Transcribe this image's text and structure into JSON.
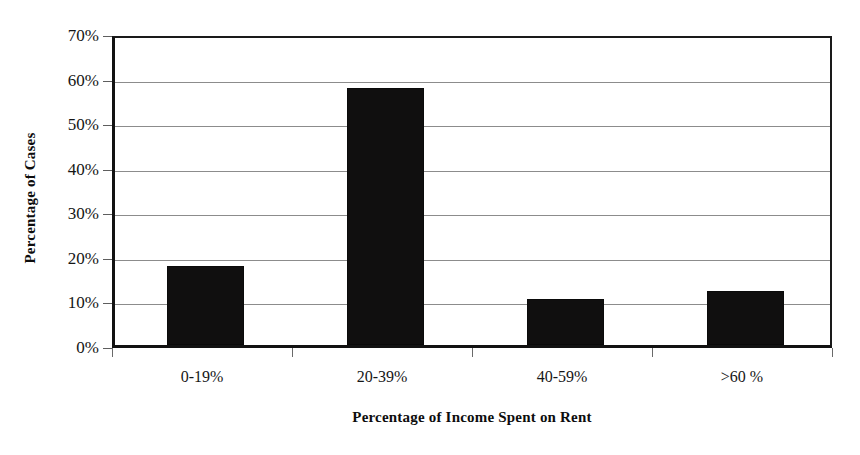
{
  "chart_data": {
    "type": "bar",
    "title": "",
    "categories": [
      "0-19%",
      "20-39%",
      "40-59%",
      ">60 %"
    ],
    "values": [
      17.8,
      57.6,
      10.3,
      12.2
    ],
    "series": [
      {
        "name": "Percentage of Cases",
        "values": [
          17.8,
          57.6,
          10.3,
          12.2
        ]
      }
    ],
    "xlabel": "Percentage of Income Spent on Rent",
    "ylabel": "Percentage of Cases",
    "ylim": [
      0,
      70
    ],
    "ytick_values": [
      0,
      10,
      20,
      30,
      40,
      50,
      60,
      70
    ],
    "ytick_labels": [
      "0%",
      "10%",
      "20%",
      "30%",
      "40%",
      "50%",
      "60%",
      "70%"
    ],
    "grid": true,
    "grid_axis": "y",
    "legend": false,
    "legend_position": "none",
    "bar_color": "#100f0f",
    "grid_color": "#8c8c8c",
    "axis_color": "#121212",
    "background_color": "#ffffff"
  }
}
